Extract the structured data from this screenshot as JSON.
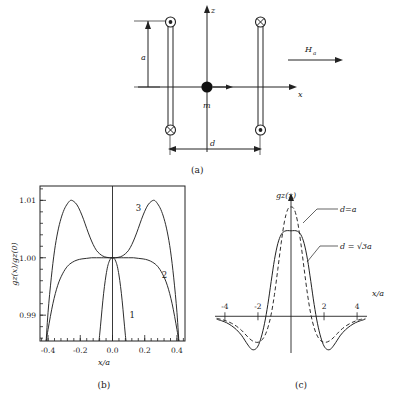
{
  "figure": {
    "panels": [
      {
        "id": "a",
        "caption": "(a)"
      },
      {
        "id": "b",
        "caption": "(b)"
      },
      {
        "id": "c",
        "caption": "(c)"
      }
    ]
  },
  "panel_a": {
    "caption": "(a)",
    "axis_z_label": "z",
    "axis_x_label": "x",
    "applied_field_label": "Ha",
    "applied_field_sub": "a",
    "applied_field_main": "H",
    "dipole_label": "m",
    "half_height_label": "a",
    "separation_label": "d",
    "coils": [
      {
        "name": "top-left",
        "symbol": "dot",
        "meaning": "current-out-of-page"
      },
      {
        "name": "top-right",
        "symbol": "cross",
        "meaning": "current-into-page"
      },
      {
        "name": "bottom-left",
        "symbol": "cross",
        "meaning": "current-into-page"
      },
      {
        "name": "bottom-right",
        "symbol": "dot",
        "meaning": "current-out-of-page"
      }
    ]
  },
  "chart_data": [
    {
      "panel": "b",
      "type": "line",
      "title": "",
      "caption": "(b)",
      "xlabel": "x/a",
      "ylabel": "gz(x)/gz(0)",
      "ylabel_main": "g",
      "ylabel_sub": "z",
      "xlim": [
        -0.45,
        0.45
      ],
      "ylim": [
        0.9855,
        1.0125
      ],
      "xticks": [
        -0.4,
        -0.2,
        0.0,
        0.2,
        0.4
      ],
      "xticklabels": [
        "-0.4",
        "-0.2",
        "0.0",
        "0.2",
        "0.4"
      ],
      "yticks": [
        0.99,
        1.0,
        1.01
      ],
      "yticklabels": [
        "0.99",
        "1.00",
        "1.01"
      ],
      "grid": false,
      "legend": "inline-curve-numbers",
      "series": [
        {
          "name": "1",
          "label": "1",
          "style": "solid",
          "description": "narrowest profile, falls off steeply near x/a = +/-0.08",
          "x": [
            -0.09,
            -0.08,
            -0.07,
            -0.06,
            -0.05,
            -0.04,
            -0.03,
            -0.02,
            -0.01,
            0.0,
            0.01,
            0.02,
            0.03,
            0.04,
            0.05,
            0.06,
            0.07,
            0.08,
            0.09
          ],
          "y": [
            0.984,
            0.9865,
            0.9895,
            0.9925,
            0.995,
            0.997,
            0.9985,
            0.9994,
            0.9999,
            1.0,
            0.9999,
            0.9994,
            0.9985,
            0.997,
            0.995,
            0.9925,
            0.9895,
            0.9865,
            0.984
          ]
        },
        {
          "name": "2",
          "label": "2",
          "style": "solid",
          "description": "broad flat maximum at 1.000, falls off beyond x/a = +/-0.25",
          "x": [
            -0.42,
            -0.4,
            -0.37,
            -0.34,
            -0.31,
            -0.28,
            -0.25,
            -0.22,
            -0.19,
            -0.16,
            -0.13,
            -0.1,
            -0.07,
            -0.04,
            0.0,
            0.04,
            0.07,
            0.1,
            0.13,
            0.16,
            0.19,
            0.22,
            0.25,
            0.28,
            0.31,
            0.34,
            0.37,
            0.4,
            0.42
          ],
          "y": [
            0.984,
            0.9875,
            0.992,
            0.9952,
            0.9972,
            0.9985,
            0.9992,
            0.9996,
            0.9998,
            0.9999,
            1.0,
            1.0,
            1.0,
            1.0,
            1.0,
            1.0,
            1.0,
            1.0,
            1.0,
            0.9999,
            0.9998,
            0.9996,
            0.9992,
            0.9985,
            0.9972,
            0.9952,
            0.992,
            0.9875,
            0.984
          ]
        },
        {
          "name": "3",
          "label": "3",
          "style": "solid",
          "description": "double-humped, peaks of 1.010 at x/a = +/-0.26, local value 1.000 at centre",
          "x": [
            -0.415,
            -0.4,
            -0.38,
            -0.36,
            -0.34,
            -0.32,
            -0.3,
            -0.28,
            -0.26,
            -0.24,
            -0.22,
            -0.2,
            -0.18,
            -0.16,
            -0.14,
            -0.12,
            -0.1,
            -0.08,
            -0.06,
            -0.04,
            -0.02,
            0.0,
            0.02,
            0.04,
            0.06,
            0.08,
            0.1,
            0.12,
            0.14,
            0.16,
            0.18,
            0.2,
            0.22,
            0.24,
            0.26,
            0.28,
            0.3,
            0.32,
            0.34,
            0.36,
            0.38,
            0.4,
            0.415
          ],
          "y": [
            0.984,
            0.9905,
            0.9965,
            1.0012,
            1.0045,
            1.0068,
            1.0084,
            1.0094,
            1.01,
            1.0098,
            1.0092,
            1.0081,
            1.0067,
            1.0051,
            1.0036,
            1.0023,
            1.0013,
            1.0007,
            1.0003,
            1.0001,
            1.0,
            1.0,
            1.0,
            1.0001,
            1.0003,
            1.0007,
            1.0013,
            1.0023,
            1.0036,
            1.0051,
            1.0067,
            1.0081,
            1.0092,
            1.0098,
            1.01,
            1.0094,
            1.0084,
            1.0068,
            1.0045,
            1.0012,
            0.9965,
            0.9905,
            0.984
          ]
        }
      ]
    },
    {
      "panel": "c",
      "type": "line",
      "title": "",
      "caption": "(c)",
      "xlabel": "x/a",
      "ylabel": "gz(x)",
      "ylabel_main": "g",
      "ylabel_sub": "z",
      "xlim": [
        -4.6,
        4.6
      ],
      "ylim": [
        -0.45,
        1.15
      ],
      "xticks": [
        -4,
        -2,
        2,
        4
      ],
      "xticklabels": [
        "-4",
        "-2",
        "2",
        "4"
      ],
      "grid": false,
      "annotations": [
        {
          "text": "d=a",
          "target_series": "d=a",
          "style": "leader-line"
        },
        {
          "text": "d = √3a",
          "target_series": "d = √3a",
          "style": "leader-line"
        }
      ],
      "series": [
        {
          "name": "d = √3a",
          "label": "d = √3a",
          "style": "solid",
          "description": "central peak ~0.86 with broad negative side lobes near x/a = +/-2.4",
          "x": [
            -4.5,
            -4.2,
            -3.9,
            -3.6,
            -3.3,
            -3.0,
            -2.8,
            -2.6,
            -2.4,
            -2.2,
            -2.0,
            -1.8,
            -1.6,
            -1.4,
            -1.2,
            -1.0,
            -0.8,
            -0.6,
            -0.4,
            -0.2,
            0.0,
            0.2,
            0.4,
            0.6,
            0.8,
            1.0,
            1.2,
            1.4,
            1.6,
            1.8,
            2.0,
            2.2,
            2.4,
            2.6,
            2.8,
            3.0,
            3.3,
            3.6,
            3.9,
            4.2,
            4.5
          ],
          "y": [
            -0.03,
            -0.045,
            -0.065,
            -0.095,
            -0.135,
            -0.19,
            -0.24,
            -0.29,
            -0.33,
            -0.335,
            -0.3,
            -0.21,
            -0.07,
            0.12,
            0.35,
            0.57,
            0.73,
            0.82,
            0.855,
            0.862,
            0.86,
            0.862,
            0.855,
            0.82,
            0.73,
            0.57,
            0.35,
            0.12,
            -0.07,
            -0.21,
            -0.3,
            -0.335,
            -0.33,
            -0.29,
            -0.24,
            -0.19,
            -0.135,
            -0.095,
            -0.065,
            -0.045,
            -0.03
          ]
        },
        {
          "name": "d=a",
          "label": "d=a",
          "style": "dashed",
          "description": "narrower, taller central peak ~1.10 with shallower negative lobes near x/a = +/-1.9",
          "x": [
            -4.5,
            -4.2,
            -3.9,
            -3.6,
            -3.3,
            -3.0,
            -2.8,
            -2.6,
            -2.4,
            -2.2,
            -2.0,
            -1.8,
            -1.6,
            -1.4,
            -1.2,
            -1.0,
            -0.8,
            -0.6,
            -0.4,
            -0.2,
            0.0,
            0.2,
            0.4,
            0.6,
            0.8,
            1.0,
            1.2,
            1.4,
            1.6,
            1.8,
            2.0,
            2.2,
            2.4,
            2.6,
            2.8,
            3.0,
            3.3,
            3.6,
            3.9,
            4.2,
            4.5
          ],
          "y": [
            -0.02,
            -0.032,
            -0.048,
            -0.07,
            -0.1,
            -0.14,
            -0.175,
            -0.21,
            -0.24,
            -0.258,
            -0.262,
            -0.245,
            -0.2,
            -0.115,
            0.02,
            0.22,
            0.47,
            0.73,
            0.95,
            1.075,
            1.1,
            1.075,
            0.95,
            0.73,
            0.47,
            0.22,
            0.02,
            -0.115,
            -0.2,
            -0.245,
            -0.262,
            -0.258,
            -0.24,
            -0.21,
            -0.175,
            -0.14,
            -0.1,
            -0.07,
            -0.048,
            -0.032,
            -0.02
          ]
        }
      ]
    }
  ]
}
